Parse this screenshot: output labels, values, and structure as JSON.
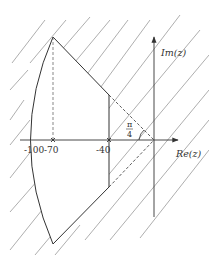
{
  "figure": {
    "type": "complex-plane-region",
    "axes": {
      "real_label": "Re(z)",
      "imag_label": "Im(z)"
    },
    "tick_labels": [
      "-100",
      "-70",
      "-40"
    ],
    "marked_points": [
      {
        "label": "-70",
        "marker": "cross"
      },
      {
        "label": "-40",
        "marker": "cross"
      }
    ],
    "angle_annotation": {
      "numerator": "π",
      "denominator": "4"
    },
    "colors": {
      "line": "#333333",
      "hatch": "#666666",
      "background": "#ffffff"
    }
  }
}
